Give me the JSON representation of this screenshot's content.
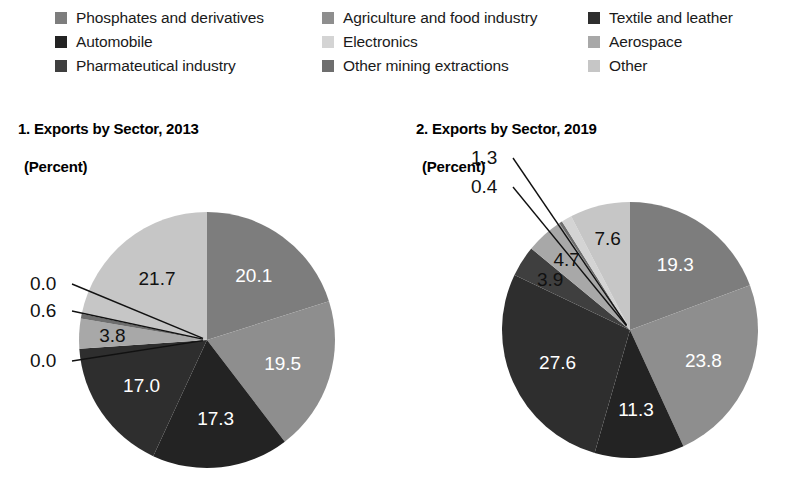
{
  "legend": {
    "columns": [
      [
        {
          "label": "Phosphates and derivatives",
          "color": "#7d7d7d"
        },
        {
          "label": "Automobile",
          "color": "#232323"
        },
        {
          "label": "Pharmateutical industry",
          "color": "#3f3f3f"
        }
      ],
      [
        {
          "label": "Agriculture and food industry",
          "color": "#8e8e8e"
        },
        {
          "label": "Electronics",
          "color": "#d4d4d4"
        },
        {
          "label": "Other mining extractions",
          "color": "#6e6e6e"
        }
      ],
      [
        {
          "label": "Textile and leather",
          "color": "#2e2e2e"
        },
        {
          "label": "Aerospace",
          "color": "#a8a8a8"
        },
        {
          "label": "Other",
          "color": "#c6c6c6"
        }
      ]
    ]
  },
  "chart_data": [
    {
      "type": "pie",
      "title": "1. Exports by Sector, 2013",
      "subtitle": "(Percent)",
      "categories": [
        "Phosphates and derivatives",
        "Agriculture and food industry",
        "Textile and leather",
        "Automobile",
        "Pharmateutical industry",
        "Other mining extractions",
        "Aerospace",
        "Electronics",
        "Other"
      ],
      "values": [
        20.1,
        19.5,
        17.3,
        17.0,
        0.0,
        3.8,
        0.6,
        0.0,
        21.7
      ],
      "colors": [
        "#7d7d7d",
        "#8e8e8e",
        "#232323",
        "#2e2e2e",
        "#3f3f3f",
        "#a8a8a8",
        "#6e6e6e",
        "#d4d4d4",
        "#c6c6c6"
      ],
      "label_styles": [
        "on-dark",
        "on-dark",
        "on-dark",
        "on-dark",
        "callout",
        "on-light",
        "callout",
        "callout",
        "on-light"
      ],
      "labels": [
        "20.1",
        "19.5",
        "17.3",
        "17.0",
        "0.0",
        "3.8",
        "0.6",
        "0.0",
        "21.7"
      ],
      "callouts": [
        {
          "label": "0.0",
          "x": 30,
          "y": 150
        },
        {
          "label": "0.6",
          "x": 30,
          "y": 177
        },
        {
          "label": "0.0",
          "x": 30,
          "y": 227
        }
      ]
    },
    {
      "type": "pie",
      "title": "2. Exports by Sector, 2019",
      "subtitle": "(Percent)",
      "categories": [
        "Phosphates and derivatives",
        "Agriculture and food industry",
        "Textile and leather",
        "Automobile",
        "Pharmateutical industry",
        "Other mining extractions",
        "Aerospace",
        "Electronics",
        "Other"
      ],
      "values": [
        19.3,
        23.8,
        11.3,
        27.6,
        3.9,
        4.7,
        0.4,
        1.3,
        7.6
      ],
      "colors": [
        "#7d7d7d",
        "#8e8e8e",
        "#232323",
        "#2e2e2e",
        "#3f3f3f",
        "#a8a8a8",
        "#6e6e6e",
        "#d4d4d4",
        "#c6c6c6"
      ],
      "label_styles": [
        "on-dark",
        "on-dark",
        "on-dark",
        "on-dark",
        "on-light",
        "on-light",
        "callout",
        "callout",
        "on-light"
      ],
      "labels": [
        "19.3",
        "23.8",
        "11.3",
        "27.6",
        "3.9",
        "4.7",
        "0.4",
        "1.3",
        "7.6"
      ],
      "callouts": [
        {
          "label": "1.3",
          "x": 75,
          "y": 24
        },
        {
          "label": "0.4",
          "x": 75,
          "y": 53
        }
      ]
    }
  ],
  "geometry": {
    "pies": [
      {
        "cx": 207,
        "cy": 200,
        "r": 128,
        "start_angle": 0
      },
      {
        "cx": 234,
        "cy": 190,
        "r": 128,
        "start_angle": 0
      }
    ]
  }
}
